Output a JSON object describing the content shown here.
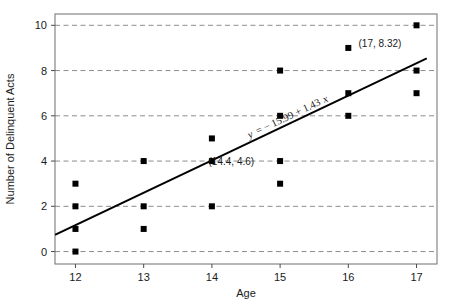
{
  "chart_data": {
    "type": "scatter",
    "title": "",
    "xlabel": "Age",
    "ylabel": "Number of Delinquent Acts",
    "xlim": [
      11.7,
      17.3
    ],
    "ylim": [
      -0.55,
      10.5
    ],
    "xticks": [
      12,
      13,
      14,
      15,
      16,
      17
    ],
    "xtick_labels": [
      "12",
      "13",
      "14",
      "15",
      "16",
      "17"
    ],
    "yticks": [
      0,
      2,
      4,
      6,
      8,
      10
    ],
    "ytick_labels": [
      "0",
      "2",
      "4",
      "6",
      "8",
      "10"
    ],
    "grid": "horizontal-dashed",
    "legend": "none",
    "marker": "filled-square",
    "marker_color": "#000000",
    "line_color": "#000000",
    "grid_color": "#8c8c8c",
    "frame_color": "#6e6e6e",
    "points": [
      {
        "x": 12,
        "y": 3
      },
      {
        "x": 12,
        "y": 2
      },
      {
        "x": 12,
        "y": 1
      },
      {
        "x": 12,
        "y": 0
      },
      {
        "x": 13,
        "y": 4
      },
      {
        "x": 13,
        "y": 2
      },
      {
        "x": 13,
        "y": 1
      },
      {
        "x": 14,
        "y": 5
      },
      {
        "x": 14,
        "y": 4
      },
      {
        "x": 14,
        "y": 2
      },
      {
        "x": 15,
        "y": 8
      },
      {
        "x": 15,
        "y": 6
      },
      {
        "x": 15,
        "y": 4
      },
      {
        "x": 15,
        "y": 3
      },
      {
        "x": 16,
        "y": 9
      },
      {
        "x": 16,
        "y": 7
      },
      {
        "x": 16,
        "y": 6
      },
      {
        "x": 17,
        "y": 10
      },
      {
        "x": 17,
        "y": 8
      },
      {
        "x": 17,
        "y": 7
      }
    ],
    "regression": {
      "intercept": -15.99,
      "slope": 1.43,
      "equation_label": "y = − 15.99 + 1.43x",
      "x_start": 11.7,
      "x_end": 17.15
    },
    "annotations": [
      {
        "name": "mean-point-label",
        "text": "(14.4, 4.6)",
        "x": 14.42,
        "y": 4.6
      },
      {
        "name": "predicted-point-label",
        "text": "(17, 8.32)",
        "x": 17.0,
        "y": 8.32
      }
    ]
  },
  "labels": {
    "x_axis_title": "Age",
    "y_axis_title": "Number of Delinquent Acts",
    "equation": "y = − 15.99 + 1.43x",
    "equation_y": "y",
    "equation_rest": "= − 15.99 + 1.43",
    "equation_x": "x",
    "annotation_mean": "(14.4, 4.6)",
    "annotation_predicted": "(17, 8.32)"
  }
}
